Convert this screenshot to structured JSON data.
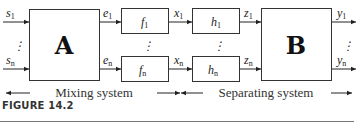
{
  "diagram": {
    "inputs": {
      "first": "s",
      "first_sub": "1",
      "last": "s",
      "last_sub": "n"
    },
    "block_a": {
      "label": "A"
    },
    "mix_outputs": {
      "first": "e",
      "first_sub": "1",
      "last": "e",
      "last_sub": "n"
    },
    "f_blocks": {
      "first": "f",
      "first_sub": "1",
      "last": "f",
      "last_sub": "n"
    },
    "x_signals": {
      "first": "x",
      "first_sub": "1",
      "last": "x",
      "last_sub": "n"
    },
    "h_blocks": {
      "first": "h",
      "first_sub": "1",
      "last": "h",
      "last_sub": "n"
    },
    "z_signals": {
      "first": "z",
      "first_sub": "1",
      "last": "z",
      "last_sub": "n"
    },
    "block_b": {
      "label": "B"
    },
    "outputs": {
      "first": "y",
      "first_sub": "1",
      "last": "y",
      "last_sub": "n"
    },
    "dots": "⋮",
    "spans": {
      "mixing": "Mixing system",
      "separating": "Separating system"
    }
  },
  "caption": {
    "figure": "FIGURE 14.2"
  }
}
